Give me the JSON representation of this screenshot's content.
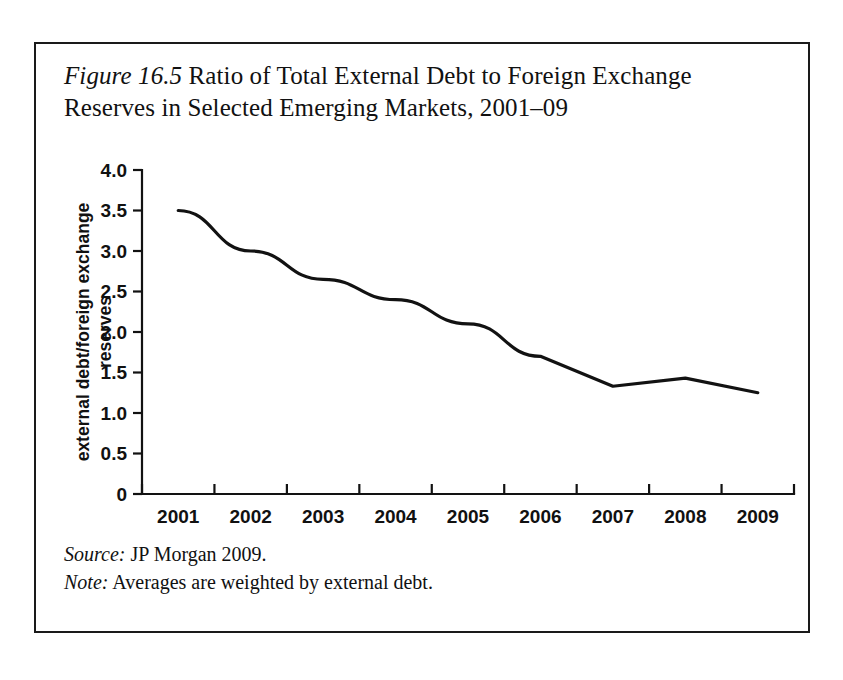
{
  "figure": {
    "label": "Figure 16.5",
    "title_rest": " Ratio of Total External Debt to Foreign Exchange Reserves in Selected Emerging Markets, 2001–09",
    "source_lead": "Source:",
    "source_text": " JP Morgan 2009.",
    "note_lead": "Note:",
    "note_text": " Averages are weighted by external debt."
  },
  "chart_data": {
    "type": "line",
    "title": "Figure 16.5 Ratio of Total External Debt to Foreign Exchange Reserves in Selected Emerging Markets, 2001–09",
    "xlabel": "",
    "ylabel": "external debt/foreign exchange reserves",
    "ylabel_line1": "external debt/foreign exchange",
    "ylabel_line2": "reserves",
    "categories": [
      "2001",
      "2002",
      "2003",
      "2004",
      "2005",
      "2006",
      "2007",
      "2008",
      "2009"
    ],
    "values": [
      3.5,
      3.0,
      2.65,
      2.4,
      2.1,
      1.7,
      1.33,
      1.43,
      1.25
    ],
    "ylim": [
      0,
      4.0
    ],
    "ytick_values": [
      0,
      0.5,
      1.0,
      1.5,
      2.0,
      2.5,
      3.0,
      3.5,
      4.0
    ],
    "ytick_labels": [
      "0",
      "0.5",
      "1.0",
      "1.5",
      "2.0",
      "2.5",
      "3.0",
      "3.5",
      "4.0"
    ],
    "grid": false,
    "legend": "none",
    "line_color": "#121212",
    "axis_color": "#121212"
  }
}
